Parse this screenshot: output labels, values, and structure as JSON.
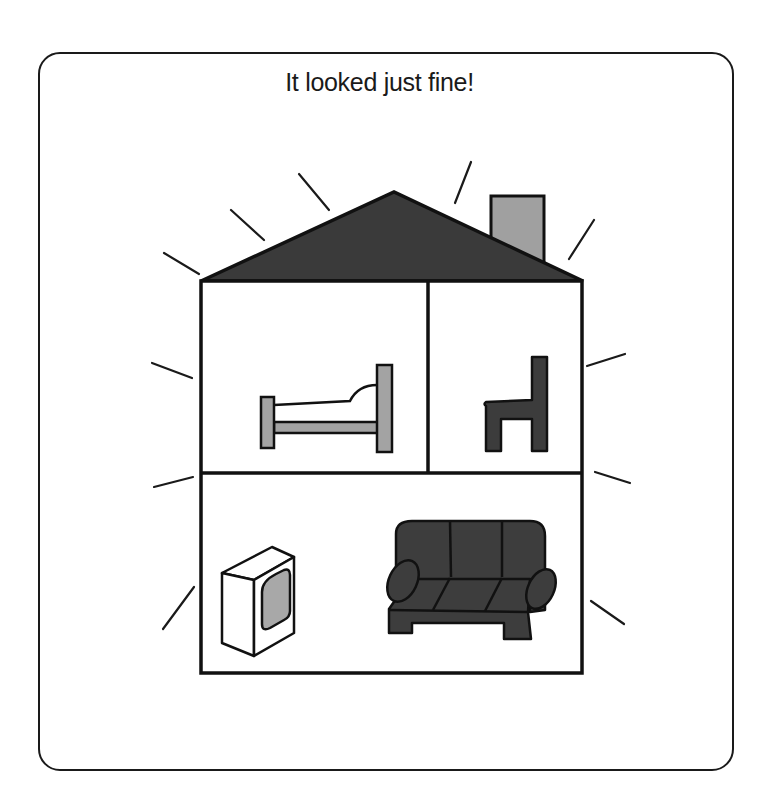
{
  "card": {
    "title": "It looked just fine!"
  },
  "illustration": {
    "subject": "house",
    "colors": {
      "outline": "#111111",
      "roof": "#3a3a3a",
      "chimney": "#a0a0a0",
      "bed_frame": "#a3a3a3",
      "chair": "#3c3c3c",
      "sofa": "#3d3d3d",
      "tv_screen": "#a8a8a8",
      "background": "#ffffff"
    },
    "rooms": [
      {
        "name": "bedroom",
        "items": [
          "bed"
        ]
      },
      {
        "name": "side-room",
        "items": [
          "chair"
        ]
      },
      {
        "name": "living-room",
        "items": [
          "tv",
          "sofa"
        ]
      }
    ],
    "radiating_lines_count": 12
  }
}
